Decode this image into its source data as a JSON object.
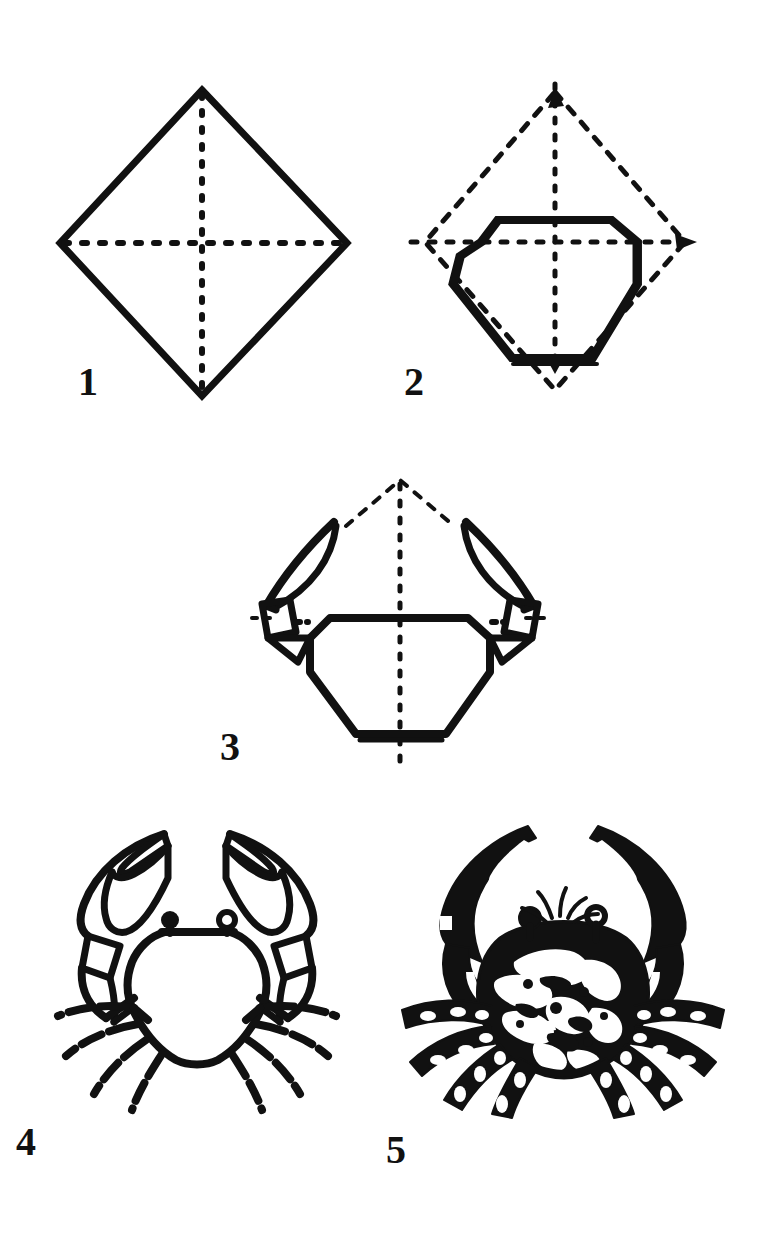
{
  "document": {
    "title": "Origami Crab Folding Diagram",
    "subject": "crab",
    "background_color": "#ffffff",
    "ink_color": "#111111",
    "total_steps": 5,
    "style": "black-and-white line art instruction sheet",
    "page_width": 771,
    "page_height": 1234
  },
  "diagram": {
    "type": "origami-instruction-sequence",
    "layout": "three rows: steps 1 and 2 side by side, step 3 centered, steps 4 and 5 side by side",
    "legend": {
      "solid_line": "edge of paper / formed outline",
      "dashed_line": "crease line or hidden underlying edge",
      "arrowhead": "direction of fold"
    }
  },
  "steps": [
    {
      "number": "1",
      "name": "square-base-diamond",
      "caption": "",
      "shape": "square rotated 45 degrees (diamond) with both dashed diagonals shown",
      "lines": {
        "solid": 4,
        "dashed": 2
      }
    },
    {
      "number": "2",
      "name": "body-outline-folded",
      "caption": "",
      "shape": "dashed diamond with solid octagonal body folded inside, small fold arrow at bottom tip",
      "lines": {
        "solid": 8,
        "dashed": 6
      }
    },
    {
      "number": "3",
      "name": "claws-formed",
      "caption": "",
      "shape": "body with two curved claw arms folded up from the side flaps, dashed center crease",
      "lines": {
        "solid": 18,
        "dashed": 5
      }
    },
    {
      "number": "4",
      "name": "crab-outline",
      "caption": "",
      "shape": "finished crab outline with two raised pincer claws, two eyes and eight segmented legs",
      "lines": {
        "solid": 40,
        "dashed": 0
      }
    },
    {
      "number": "5",
      "name": "crab-inked",
      "caption": "",
      "shape": "finished crab rendered as a solid black inked silhouette with mottled shell texture",
      "lines": {
        "solid": 0,
        "dashed": 0
      }
    }
  ],
  "colors": {
    "ink": "#111111",
    "paper": "#ffffff"
  }
}
